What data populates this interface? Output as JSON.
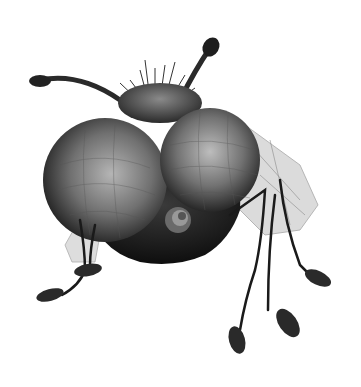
{
  "image": {
    "subject": "fly-creature-illustration",
    "style": "grayscale-engraving",
    "width": 361,
    "height": 387,
    "colors": {
      "background": "#ffffff",
      "dark": "#1a1a1a",
      "mid": "#555555",
      "eye_light": "#9a9a9a",
      "wing": "#c8c8c8"
    }
  }
}
